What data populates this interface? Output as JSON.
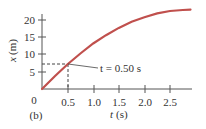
{
  "chart_data": {
    "type": "line",
    "title": "",
    "panel_label": "(b)",
    "xlabel": "t (s)",
    "ylabel": "x (m)",
    "xlabel_var": "t",
    "xlabel_unit": "(s)",
    "ylabel_var": "x",
    "ylabel_unit": "(m)",
    "xlim": [
      0,
      2.9
    ],
    "ylim": [
      0,
      23
    ],
    "x_ticks": [
      "0.5",
      "1.0",
      "1.5",
      "2.0",
      "2.5"
    ],
    "y_ticks": [
      "5",
      "10",
      "15",
      "20"
    ],
    "origin_label": "0",
    "grid": false,
    "series": [
      {
        "name": "x(t)",
        "color": "#c0504d",
        "x": [
          0,
          0.25,
          0.5,
          0.75,
          1.0,
          1.25,
          1.5,
          1.75,
          2.0,
          2.25,
          2.5,
          2.75,
          2.9
        ],
        "y": [
          0,
          3.7,
          7.2,
          10.3,
          13.2,
          15.6,
          17.7,
          19.5,
          20.8,
          21.9,
          22.6,
          22.9,
          23.0
        ]
      }
    ],
    "annotation": {
      "text": "t = 0.50 s",
      "point": {
        "t": 0.5,
        "x": 7.3
      },
      "dashed_guides": true
    }
  }
}
